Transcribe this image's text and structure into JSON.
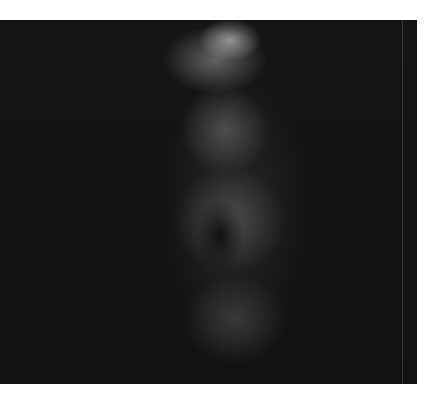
{
  "image": {
    "subject": "Milky Way star field photograph (grayscale)",
    "frame": {
      "left": 0,
      "top": 20,
      "width": 417,
      "height": 364
    },
    "background_color": "#141414",
    "margin_color": "#ffffff",
    "bright_stars": [
      {
        "x": 357,
        "y": 35,
        "r": 5
      },
      {
        "x": 218,
        "y": 196,
        "r": 5
      },
      {
        "x": 186,
        "y": 221,
        "r": 5
      },
      {
        "x": 214,
        "y": 317,
        "r": 6
      },
      {
        "x": 240,
        "y": 358,
        "r": 5
      },
      {
        "x": 95,
        "y": 165,
        "r": 2
      },
      {
        "x": 77,
        "y": 221,
        "r": 2
      },
      {
        "x": 70,
        "y": 300,
        "r": 2
      },
      {
        "x": 137,
        "y": 306,
        "r": 2
      },
      {
        "x": 283,
        "y": 206,
        "r": 2
      },
      {
        "x": 332,
        "y": 350,
        "r": 1.5
      }
    ]
  }
}
